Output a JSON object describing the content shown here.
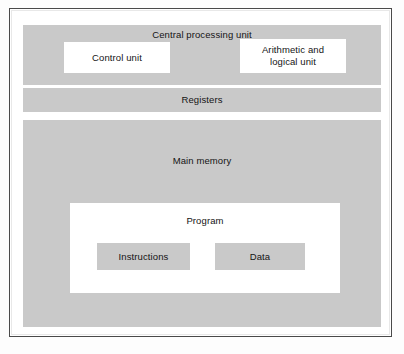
{
  "figure": {
    "colors": {
      "block_fill": "#c9c9c9",
      "inner_fill": "#ffffff",
      "frame_stroke": "#4a4a4a",
      "text": "#141414",
      "page_background": "#fdfdfd"
    }
  },
  "blocks": {
    "cpu": {
      "label": "Central processing unit",
      "children": {
        "control_unit": {
          "label": "Control unit"
        },
        "alu": {
          "label": "Arithmetic and\nlogical unit"
        }
      }
    },
    "registers": {
      "label": "Registers"
    },
    "main_memory": {
      "label": "Main memory",
      "children": {
        "program": {
          "label": "Program",
          "children": {
            "instructions": {
              "label": "Instructions"
            },
            "data": {
              "label": "Data"
            }
          }
        }
      }
    }
  }
}
